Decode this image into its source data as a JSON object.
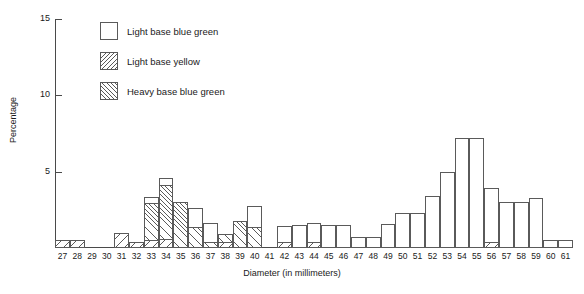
{
  "chart_data": {
    "type": "bar",
    "title": "",
    "subtitle": "",
    "xlabel": "Diameter  (in millimeters)",
    "ylabel": "Percentage",
    "ylim": [
      0,
      15
    ],
    "yticks": [
      5,
      10,
      15
    ],
    "ytick_labels": [
      "5",
      "10",
      "15"
    ],
    "grid": false,
    "stacked": true,
    "legend_position": "top-center",
    "categories": [
      27,
      28,
      29,
      30,
      31,
      32,
      33,
      34,
      35,
      36,
      37,
      38,
      39,
      40,
      41,
      42,
      43,
      44,
      45,
      46,
      47,
      48,
      49,
      50,
      51,
      52,
      53,
      54,
      55,
      56,
      57,
      58,
      59,
      60,
      61
    ],
    "tick_labels": [
      "27",
      "28",
      "29",
      "30",
      "31",
      "32",
      "33",
      "34",
      "35",
      "36",
      "37",
      "38",
      "39",
      "40",
      "41",
      "42",
      "43",
      "44",
      "45",
      "46",
      "47",
      "48",
      "49",
      "50",
      "51",
      "52",
      "53",
      "54",
      "55",
      "56",
      "57",
      "58",
      "59",
      "60",
      "61"
    ],
    "series": [
      {
        "name": "Light base blue green",
        "pattern": "plain",
        "values": [
          0,
          0,
          0,
          0,
          0,
          0,
          0.5,
          0.5,
          0,
          1.3,
          1.3,
          0,
          0,
          1.4,
          0,
          1.1,
          1.5,
          1.3,
          1.5,
          1.5,
          0.7,
          0.7,
          1.6,
          2.3,
          2.3,
          3.4,
          5.0,
          7.2,
          7.2,
          3.6,
          3.0,
          3.0,
          3.3,
          0.5,
          0.5
        ]
      },
      {
        "name": "Light base yellow",
        "pattern": "hatch-back",
        "values": [
          0.5,
          0.5,
          0,
          0,
          1.0,
          0.4,
          0.5,
          0.6,
          0,
          0,
          0,
          0.4,
          0,
          0,
          0,
          0.4,
          0,
          0.4,
          0,
          0,
          0,
          0,
          0,
          0,
          0,
          0,
          0,
          0,
          0,
          0.4,
          0,
          0,
          0,
          0,
          0
        ]
      },
      {
        "name": "Heavy base blue green",
        "pattern": "hatch-fwd",
        "values": [
          0,
          0,
          0,
          0,
          0,
          0,
          2.5,
          3.6,
          3.0,
          1.4,
          0.4,
          0.6,
          1.8,
          1.4,
          0,
          0,
          0,
          0,
          0,
          0,
          0,
          0,
          0,
          0,
          0,
          0,
          0,
          0,
          0,
          0,
          0,
          0,
          0,
          0,
          0
        ]
      }
    ],
    "totals": [
      0.5,
      0.5,
      0,
      0,
      1.0,
      0.4,
      3.5,
      4.7,
      3.0,
      2.7,
      1.7,
      1.0,
      1.8,
      2.8,
      0,
      1.5,
      1.5,
      1.7,
      1.5,
      1.5,
      0.7,
      0.7,
      1.6,
      2.3,
      2.3,
      3.4,
      5.0,
      7.2,
      7.2,
      4.0,
      3.0,
      3.0,
      3.3,
      0.5,
      0.5
    ]
  },
  "legend": {
    "items": [
      {
        "label": "Light base blue green",
        "pattern": "plain"
      },
      {
        "label": "Light base yellow",
        "pattern": "hatch-back"
      },
      {
        "label": "Heavy base blue green",
        "pattern": "hatch-fwd"
      }
    ]
  }
}
